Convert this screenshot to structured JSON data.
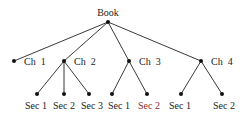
{
  "diagram": {
    "type": "tree",
    "root": {
      "label": "Book",
      "children": [
        {
          "label": "Ch  1",
          "children": []
        },
        {
          "label": "Ch  2",
          "children": [
            {
              "label": "Sec 1"
            },
            {
              "label": "Sec 2"
            },
            {
              "label": "Sec 3"
            }
          ]
        },
        {
          "label": "Ch  3",
          "children": [
            {
              "label": "Sec 1"
            },
            {
              "label": "Sec 2"
            }
          ]
        },
        {
          "label": "Ch  4",
          "children": [
            {
              "label": "Sec 1"
            },
            {
              "label": "Sec 2"
            }
          ]
        }
      ]
    },
    "colors": {
      "line": "#222222",
      "node": "#111111",
      "text": "#222222",
      "highlight_text": "#8a2a2a"
    }
  }
}
